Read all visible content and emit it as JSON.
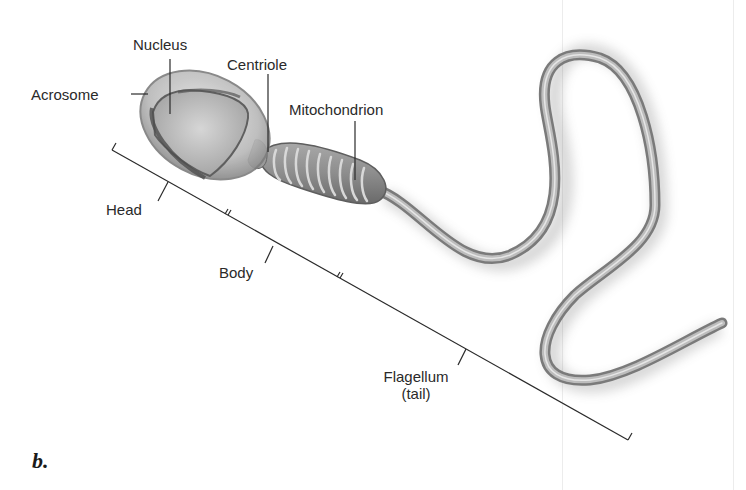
{
  "figure": {
    "panel_label": "b.",
    "labels": {
      "nucleus": "Nucleus",
      "acrosome": "Acrosome",
      "centriole": "Centriole",
      "mitochondrion": "Mitochondrion",
      "head": "Head",
      "body": "Body",
      "flagellum_line1": "Flagellum",
      "flagellum_line2": "(tail)"
    },
    "colors": {
      "cell_fill": "#b8b8b8",
      "cell_dark": "#6e6e6e",
      "leader_line": "#2a2a2a"
    }
  }
}
